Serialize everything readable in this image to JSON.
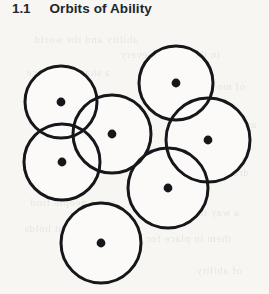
{
  "page": {
    "width": 269,
    "height": 294,
    "background_color": "#f7f6f3",
    "kind": "scanned-book-page"
  },
  "heading": {
    "number": "1.1",
    "title": "Orbits of Ability"
  },
  "colors": {
    "stroke": "#15171a",
    "dot": "#15171a",
    "overlap_fill": "#b5b5b5",
    "overlap_fill_deep": "#8d8d8d",
    "circle_fill": "#fbfaf8",
    "text": "#23262a",
    "page_background": "#f7f6f3"
  },
  "diagram": {
    "name": "orbits-of-ability-diagram",
    "stroke_width": 3,
    "dot_radius": 4.4,
    "circles": [
      {
        "id": "orbit-1",
        "label": "top-left",
        "cx": 61,
        "cy": 102,
        "r": 36
      },
      {
        "id": "orbit-2",
        "label": "centre",
        "cx": 112,
        "cy": 134,
        "r": 39
      },
      {
        "id": "orbit-3",
        "label": "left-lower",
        "cx": 62,
        "cy": 162,
        "r": 38
      },
      {
        "id": "orbit-4",
        "label": "top-right",
        "cx": 176,
        "cy": 83,
        "r": 37
      },
      {
        "id": "orbit-5",
        "label": "right",
        "cx": 208,
        "cy": 140,
        "r": 42
      },
      {
        "id": "orbit-6",
        "label": "lower-right",
        "cx": 168,
        "cy": 188,
        "r": 40
      },
      {
        "id": "orbit-7",
        "label": "bottom",
        "cx": 101,
        "cy": 243,
        "r": 40
      }
    ],
    "overlaps": [
      {
        "id": "overlap-1-2",
        "between": [
          "orbit-1",
          "orbit-2"
        ],
        "shade": "light"
      },
      {
        "id": "overlap-1-3",
        "between": [
          "orbit-1",
          "orbit-3"
        ],
        "shade": "light"
      },
      {
        "id": "overlap-2-3",
        "between": [
          "orbit-2",
          "orbit-3"
        ],
        "shade": "light"
      },
      {
        "id": "overlap-1-2-3",
        "between": [
          "orbit-1",
          "orbit-2",
          "orbit-3"
        ],
        "shade": "deep"
      },
      {
        "id": "overlap-4-5",
        "between": [
          "orbit-4",
          "orbit-5"
        ],
        "shade": "light"
      },
      {
        "id": "overlap-5-6",
        "between": [
          "orbit-5",
          "orbit-6"
        ],
        "shade": "light"
      }
    ]
  },
  "bleed_text": {
    "lines": [
      {
        "text": "ability and the world",
        "x": 34,
        "y": 33,
        "size": 11
      },
      {
        "text": "in the orbit of every",
        "x": 120,
        "y": 48,
        "size": 11
      },
      {
        "text": "a shared practice",
        "x": 26,
        "y": 66,
        "size": 11
      },
      {
        "text": "of moving between",
        "x": 150,
        "y": 80,
        "size": 11
      },
      {
        "text": "the circles widen",
        "x": 40,
        "y": 104,
        "size": 11
      },
      {
        "text": "and overlap again",
        "x": 168,
        "y": 118,
        "size": 11
      },
      {
        "text": "each one a centre",
        "x": 22,
        "y": 150,
        "size": 11
      },
      {
        "text": "drawn together",
        "x": 174,
        "y": 166,
        "size": 11
      },
      {
        "text": "some people find",
        "x": 30,
        "y": 196,
        "size": 11
      },
      {
        "text": "a way through the",
        "x": 150,
        "y": 206,
        "size": 11
      },
      {
        "text": "work that holds",
        "x": 24,
        "y": 222,
        "size": 11
      },
      {
        "text": "them in place for",
        "x": 146,
        "y": 232,
        "size": 11
      },
      {
        "text": "the longer time",
        "x": 60,
        "y": 248,
        "size": 11
      },
      {
        "text": "of ability",
        "x": 196,
        "y": 264,
        "size": 11
      }
    ]
  }
}
